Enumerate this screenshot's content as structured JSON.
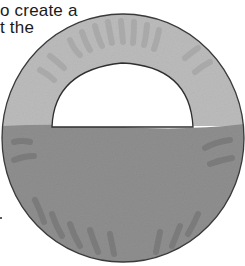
{
  "document": {
    "text_lines": [
      "o create a",
      "t the"
    ]
  },
  "illustration": {
    "description": "paper-plate-arch",
    "colors": {
      "upper_half": "#bcbcbc",
      "lower_half": "#8f8f8f",
      "outline": "#3a3a3a",
      "cutout": "#ffffff",
      "streak_light": "#a6a6a6",
      "streak_dark": "#767676"
    }
  }
}
